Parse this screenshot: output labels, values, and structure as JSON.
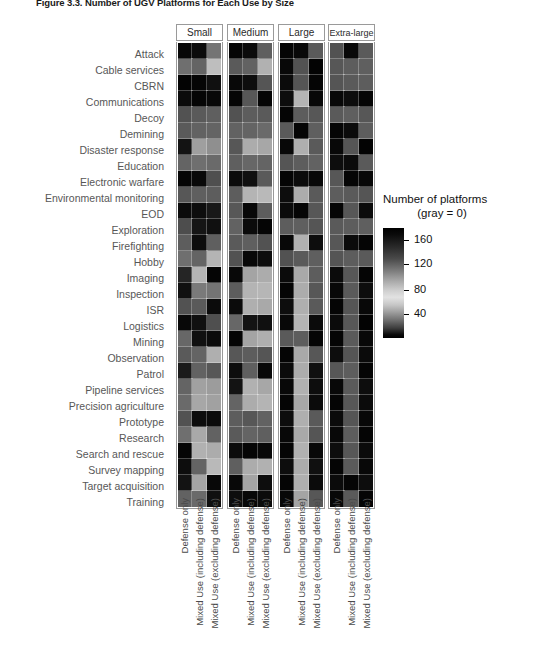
{
  "figure": {
    "title_number": "Figure 3.3.",
    "title_text": "Number of UGV Platforms for Each Use by Size",
    "title_full": "Figure 3.3. Number of UGV Platforms for Each Use by Size"
  },
  "legend": {
    "title_line1": "Number of platforms",
    "title_line2": "(gray = 0)",
    "ticks": [
      {
        "label": "160",
        "value": 160
      },
      {
        "label": "120",
        "value": 120
      },
      {
        "label": "80",
        "value": 80
      },
      {
        "label": "40",
        "value": 40
      }
    ]
  },
  "chart_data": {
    "type": "heatmap",
    "title": "Figure 3.3. Number of UGV Platforms for Each Use by Size",
    "xlabel": "",
    "ylabel": "",
    "colorbar_label": "Number of platforms (gray = 0)",
    "colorbar_ticks": [
      40,
      80,
      120,
      160
    ],
    "zlim": [
      0,
      180
    ],
    "grid": false,
    "legend_position": "right",
    "panels": [
      "Small",
      "Medium",
      "Large",
      "Extra-large"
    ],
    "columns": [
      "Defense only",
      "Mixed Use (including defense)",
      "Mixed Use (excluding defense)"
    ],
    "categories": [
      "Attack",
      "Cable services",
      "CBRN",
      "Communications",
      "Decoy",
      "Demining",
      "Disaster response",
      "Education",
      "Electronic warfare",
      "Environmental monitoring",
      "EOD",
      "Exploration",
      "Firefighting",
      "Hobby",
      "Imaging",
      "Inspection",
      "ISR",
      "Logistics",
      "Mining",
      "Observation",
      "Patrol",
      "Pipeline services",
      "Precision agriculture",
      "Prototype",
      "Research",
      "Search and rescue",
      "Survey mapping",
      "Target acquisition",
      "Training"
    ],
    "series": [
      {
        "panel": "Small",
        "values": [
          [
            175,
            172,
            92
          ],
          [
            96,
            104,
            36
          ],
          [
            178,
            176,
            168
          ],
          [
            172,
            176,
            174
          ],
          [
            118,
            112,
            108
          ],
          [
            112,
            106,
            104
          ],
          [
            166,
            60,
            72
          ],
          [
            104,
            96,
            100
          ],
          [
            176,
            174,
            120
          ],
          [
            114,
            108,
            110
          ],
          [
            172,
            170,
            162
          ],
          [
            122,
            164,
            168
          ],
          [
            110,
            170,
            108
          ],
          [
            96,
            104,
            44
          ],
          [
            152,
            44,
            176
          ],
          [
            168,
            88,
            92
          ],
          [
            118,
            112,
            172
          ],
          [
            174,
            168,
            120
          ],
          [
            102,
            168,
            172
          ],
          [
            112,
            104,
            48
          ],
          [
            160,
            106,
            114
          ],
          [
            104,
            58,
            62
          ],
          [
            100,
            54,
            58
          ],
          [
            118,
            170,
            172
          ],
          [
            96,
            52,
            106
          ],
          [
            176,
            46,
            50
          ],
          [
            170,
            104,
            40
          ],
          [
            166,
            56,
            174
          ],
          [
            106,
            100,
            168
          ]
        ]
      },
      {
        "panel": "Medium",
        "values": [
          [
            176,
            172,
            108
          ],
          [
            112,
            106,
            46
          ],
          [
            174,
            170,
            116
          ],
          [
            176,
            114,
            176
          ],
          [
            118,
            110,
            112
          ],
          [
            106,
            104,
            100
          ],
          [
            114,
            50,
            54
          ],
          [
            108,
            102,
            104
          ],
          [
            172,
            168,
            112
          ],
          [
            110,
            44,
            40
          ],
          [
            114,
            174,
            110
          ],
          [
            106,
            172,
            176
          ],
          [
            112,
            108,
            118
          ],
          [
            118,
            174,
            170
          ],
          [
            174,
            56,
            50
          ],
          [
            110,
            44,
            42
          ],
          [
            172,
            48,
            52
          ],
          [
            102,
            166,
            168
          ],
          [
            176,
            56,
            48
          ],
          [
            114,
            110,
            116
          ],
          [
            170,
            108,
            174
          ],
          [
            166,
            46,
            54
          ],
          [
            104,
            50,
            44
          ],
          [
            110,
            114,
            106
          ],
          [
            112,
            104,
            108
          ],
          [
            172,
            176,
            174
          ],
          [
            108,
            50,
            46
          ],
          [
            174,
            56,
            170
          ],
          [
            170,
            174,
            172
          ]
        ]
      },
      {
        "panel": "Large",
        "values": [
          [
            176,
            174,
            112
          ],
          [
            174,
            118,
            178
          ],
          [
            172,
            116,
            176
          ],
          [
            170,
            44,
            174
          ],
          [
            176,
            110,
            114
          ],
          [
            112,
            176,
            108
          ],
          [
            174,
            48,
            112
          ],
          [
            116,
            110,
            106
          ],
          [
            176,
            172,
            174
          ],
          [
            170,
            50,
            112
          ],
          [
            172,
            176,
            114
          ],
          [
            110,
            108,
            116
          ],
          [
            174,
            46,
            170
          ],
          [
            118,
            112,
            108
          ],
          [
            172,
            52,
            110
          ],
          [
            176,
            50,
            114
          ],
          [
            170,
            48,
            112
          ],
          [
            174,
            44,
            172
          ],
          [
            112,
            110,
            176
          ],
          [
            176,
            52,
            114
          ],
          [
            172,
            50,
            168
          ],
          [
            174,
            46,
            170
          ],
          [
            176,
            54,
            172
          ],
          [
            170,
            48,
            112
          ],
          [
            174,
            52,
            116
          ],
          [
            176,
            46,
            174
          ],
          [
            170,
            50,
            168
          ],
          [
            176,
            48,
            172
          ],
          [
            174,
            56,
            114
          ]
        ]
      },
      {
        "panel": "Extra-large",
        "values": [
          [
            118,
            174,
            112
          ],
          [
            114,
            110,
            108
          ],
          [
            116,
            112,
            110
          ],
          [
            174,
            170,
            176
          ],
          [
            112,
            108,
            114
          ],
          [
            176,
            172,
            110
          ],
          [
            174,
            116,
            178
          ],
          [
            170,
            172,
            112
          ],
          [
            114,
            176,
            174
          ],
          [
            110,
            112,
            116
          ],
          [
            176,
            114,
            172
          ],
          [
            112,
            110,
            108
          ],
          [
            114,
            172,
            176
          ],
          [
            116,
            110,
            112
          ],
          [
            172,
            114,
            176
          ],
          [
            174,
            112,
            170
          ],
          [
            176,
            116,
            174
          ],
          [
            172,
            114,
            178
          ],
          [
            176,
            112,
            174
          ],
          [
            170,
            116,
            172
          ],
          [
            114,
            110,
            176
          ],
          [
            174,
            112,
            170
          ],
          [
            176,
            114,
            172
          ],
          [
            172,
            116,
            174
          ],
          [
            174,
            110,
            176
          ],
          [
            170,
            114,
            172
          ],
          [
            176,
            112,
            174
          ],
          [
            172,
            176,
            170
          ],
          [
            174,
            112,
            176
          ]
        ]
      }
    ]
  }
}
